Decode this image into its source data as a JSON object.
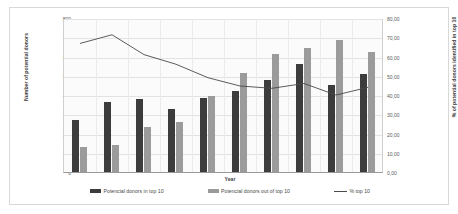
{
  "chart_data": {
    "type": "bar",
    "title": "",
    "subtitle": "",
    "xlabel": "Year",
    "ylabel": "Number of potential donors",
    "y2label": "% of potential donors identified in top 10",
    "categories": [
      "2011",
      "2012",
      "2013",
      "2014",
      "2015",
      "2016",
      "2017",
      "2018",
      "2019",
      "2020"
    ],
    "ylim": [
      0,
      800
    ],
    "y2lim": [
      0,
      80
    ],
    "yticks": [
      "0",
      "100",
      "200",
      "300",
      "400",
      "500",
      "600",
      "700",
      "800"
    ],
    "ytick_values": [
      0,
      100,
      200,
      300,
      400,
      500,
      600,
      700,
      800
    ],
    "y2ticks": [
      "0,00",
      "10,00",
      "20,00",
      "30,00",
      "40,00",
      "50,00",
      "60,00",
      "70,00",
      "80,00"
    ],
    "y2tick_values": [
      0,
      10,
      20,
      30,
      40,
      50,
      60,
      70,
      80
    ],
    "grid": true,
    "legend_position": "bottom",
    "series": [
      {
        "name": "Potencial donors in top 10",
        "type": "bar",
        "axis": "left",
        "color": "#3c3c3c",
        "values": [
          270,
          365,
          380,
          327,
          383,
          423,
          478,
          562,
          453,
          510
        ]
      },
      {
        "name": "Potencial donors out of top 10",
        "type": "bar",
        "axis": "left",
        "color": "#9b9b9b",
        "values": [
          128,
          140,
          235,
          260,
          395,
          512,
          612,
          643,
          687,
          623
        ]
      },
      {
        "name": "% top 10",
        "type": "line",
        "axis": "right",
        "color": "#4a4a4a",
        "values": [
          67.3,
          71.8,
          61.5,
          56.5,
          49.5,
          45.2,
          44.0,
          46.5,
          40.5,
          44.5
        ]
      }
    ]
  },
  "legend": {
    "items": [
      {
        "label": "Potencial donors in top 10",
        "marker": "bar-swatch-dark"
      },
      {
        "label": "Potencial donors out of top 10",
        "marker": "bar-swatch-gray"
      },
      {
        "label": "% top 10",
        "marker": "line-swatch"
      }
    ]
  }
}
